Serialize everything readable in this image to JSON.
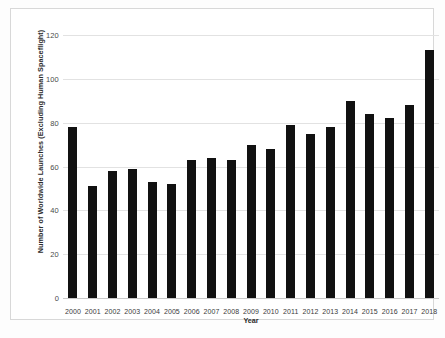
{
  "chart_data": {
    "type": "bar",
    "title": "",
    "xlabel": "Year",
    "ylabel": "Number of Worldwide Launches (Excluding Human Spaceflight)",
    "categories": [
      "2000",
      "2001",
      "2002",
      "2003",
      "2004",
      "2005",
      "2006",
      "2007",
      "2008",
      "2009",
      "2010",
      "2011",
      "2012",
      "2013",
      "2014",
      "2015",
      "2016",
      "2017",
      "2018"
    ],
    "values": [
      78,
      51,
      58,
      59,
      53,
      52,
      63,
      64,
      63,
      70,
      68,
      79,
      75,
      78,
      90,
      84,
      82,
      88,
      113
    ],
    "ylim": [
      0,
      120
    ],
    "yticks": [
      0,
      20,
      40,
      60,
      80,
      100,
      120
    ],
    "ytick_labels": [
      "0",
      "20",
      "40",
      "60",
      "80",
      "100",
      "120"
    ],
    "grid": true,
    "legend": "none",
    "bar_color": "#111111",
    "gridline_color": "#e2e2e2",
    "axis_color": "#c9c9c9",
    "background_color": "#ffffff"
  }
}
